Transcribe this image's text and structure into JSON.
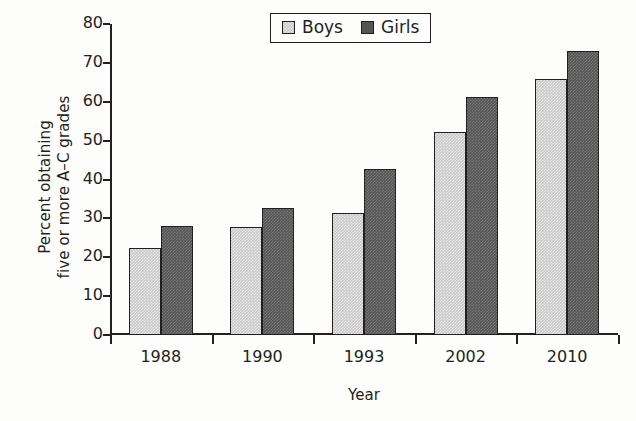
{
  "chart_data": {
    "type": "bar",
    "title": "",
    "subtitle": "",
    "xlabel": "Year",
    "ylabel": "Percent obtaining five or more A–C grades",
    "ylabel_lines": [
      "Percent obtaining",
      "five or more A–C grades"
    ],
    "categories": [
      "1988",
      "1990",
      "1993",
      "2002",
      "2010"
    ],
    "series": [
      {
        "name": "Boys",
        "color": "#c9c9c9",
        "values": [
          22.3,
          27.8,
          31.3,
          52.3,
          65.8
        ]
      },
      {
        "name": "Girls",
        "color": "#565656",
        "values": [
          28.0,
          32.7,
          42.8,
          61.3,
          73.0
        ]
      }
    ],
    "ylim": [
      0,
      80
    ],
    "ytick_values": [
      0,
      10,
      20,
      30,
      40,
      50,
      60,
      70,
      80
    ],
    "ytick_labels": [
      "0",
      "10",
      "20",
      "30",
      "40",
      "50",
      "60",
      "70",
      "80"
    ],
    "grid": false,
    "legend_position": "top-center-right",
    "axis_color": "#231f20",
    "background_color": "#fdfdfc"
  },
  "legend": {
    "items": [
      {
        "label": "Boys",
        "swatch": "legend-swatch-boys"
      },
      {
        "label": "Girls",
        "swatch": "legend-swatch-girls"
      }
    ]
  },
  "axes": {
    "x_title": "Year",
    "y_title_line1": "Percent obtaining",
    "y_title_line2": "five or more A–C grades"
  }
}
